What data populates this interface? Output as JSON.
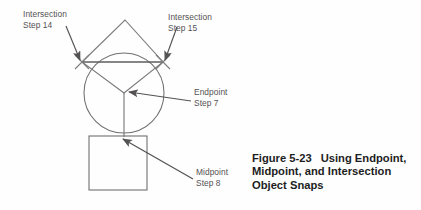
{
  "figure": {
    "caption_number": "Figure 5-23",
    "caption_text": "Using Endpoint, Midpoint, and Intersection Object Snaps",
    "background_color": "#fefefe",
    "line_color": "#6b6b6b",
    "arrow_color": "#555253",
    "label_color": "#555253",
    "caption_color": "#1d1d1d"
  },
  "annotations": [
    {
      "id": "intersection-step-14",
      "title": "Intersection",
      "step": "Step 14",
      "target": "upper-left circle-diamond intersection"
    },
    {
      "id": "intersection-step-15",
      "title": "Intersection",
      "step": "Step 15",
      "target": "upper-right circle-diamond intersection"
    },
    {
      "id": "endpoint-step-7",
      "title": "Endpoint",
      "step": "Step 7",
      "target": "circle center / line endpoint"
    },
    {
      "id": "midpoint-step-8",
      "title": "Midpoint",
      "step": "Step 8",
      "target": "midpoint of square top edge"
    }
  ],
  "shapes": {
    "circle": {
      "cx": 124,
      "cy": 93,
      "r": 40
    },
    "diamond": {
      "apex_x": 125,
      "apex_y": 20,
      "left_x": 82,
      "left_y": 62,
      "right_x": 163,
      "right_y": 62,
      "bottom_x": 124,
      "bottom_y": 93
    },
    "chord": {
      "x1": 83,
      "y1": 62,
      "x2": 163,
      "y2": 62
    },
    "square": {
      "x": 89,
      "y": 136,
      "width": 58,
      "height": 54
    },
    "radials": [
      {
        "x1": 124,
        "y1": 93,
        "x2": 83,
        "y2": 62
      },
      {
        "x1": 124,
        "y1": 93,
        "x2": 163,
        "y2": 62
      },
      {
        "x1": 124,
        "y1": 93,
        "x2": 124,
        "y2": 136
      }
    ],
    "snap_markers": [
      {
        "cx": 82,
        "cy": 62,
        "type": "intersection-x"
      },
      {
        "cx": 163,
        "cy": 62,
        "type": "intersection-x"
      }
    ]
  },
  "leaders": [
    {
      "id": "leader-14",
      "x1": 66,
      "y1": 26,
      "x2": 80,
      "y2": 60
    },
    {
      "id": "leader-15",
      "x1": 177,
      "y1": 27,
      "x2": 165,
      "y2": 60
    },
    {
      "id": "leader-7",
      "x1": 191,
      "y1": 101,
      "x2": 128,
      "y2": 92
    },
    {
      "id": "leader-8",
      "x1": 193,
      "y1": 179,
      "x2": 122,
      "y2": 138
    }
  ]
}
